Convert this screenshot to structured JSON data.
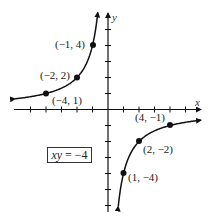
{
  "chart_data": {
    "type": "line",
    "title": "",
    "equation": "xy = −4",
    "xlabel": "x",
    "ylabel": "y",
    "xlim": [
      -6,
      6
    ],
    "ylim": [
      -6,
      6
    ],
    "x_ticks": [
      -5,
      -4,
      -3,
      -2,
      -1,
      1,
      2,
      3,
      4,
      5
    ],
    "y_ticks": [
      -6,
      -5,
      -4,
      -3,
      -2,
      -1,
      1,
      2,
      3,
      4,
      5
    ],
    "grid": false,
    "series": [
      {
        "name": "xy = -4 (branch x<0)",
        "function": "y = -4/x",
        "x_range": [
          -6,
          -0.7
        ],
        "points": [
          {
            "x": -4,
            "y": 1,
            "label": "(−4, 1)"
          },
          {
            "x": -2,
            "y": 2,
            "label": "(−2, 2)"
          },
          {
            "x": -1,
            "y": 4,
            "label": "(−1, 4)"
          }
        ]
      },
      {
        "name": "xy = -4 (branch x>0)",
        "function": "y = -4/x",
        "x_range": [
          0.7,
          6
        ],
        "points": [
          {
            "x": 1,
            "y": -4,
            "label": "(1, −4)"
          },
          {
            "x": 2,
            "y": -2,
            "label": "(2, −2)"
          },
          {
            "x": 4,
            "y": -1,
            "label": "(4, −1)"
          }
        ]
      }
    ]
  },
  "labels": {
    "x_axis": "x",
    "y_axis": "y",
    "equation_lhs": "xy",
    "equation_rhs": " = −4",
    "p_m4_1": "(−4, 1)",
    "p_m2_2": "(−2, 2)",
    "p_m1_4": "(−1, 4)",
    "p_1_m4": "(1, −4)",
    "p_2_m2": "(2, −2)",
    "p_4_m1": "(4, −1)"
  }
}
